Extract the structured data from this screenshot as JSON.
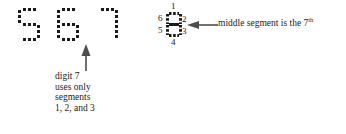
{
  "figure": {
    "background": "#ffffff",
    "ink": "#1a1a1a",
    "digits": [
      {
        "char": "5",
        "segments_on": [
          "top",
          "tl",
          "mid",
          "br",
          "bot"
        ]
      },
      {
        "char": "6",
        "segments_on": [
          "top",
          "tl",
          "mid",
          "bl",
          "br",
          "bot"
        ]
      },
      {
        "char": "7",
        "segments_on": [
          "top",
          "tr",
          "br"
        ]
      }
    ],
    "left_caption": {
      "line1": "digit 7",
      "line2": "uses only",
      "line3": "segments",
      "line4": "1, 2, and 3"
    },
    "segment_labels": {
      "top": "1",
      "upper_right": "2",
      "lower_right": "3",
      "bottom": "4",
      "lower_left": "5",
      "upper_left": "6",
      "middle": "7"
    },
    "right_note": {
      "text": "middle segment is the 7",
      "ordinal_suffix": "th"
    },
    "arrows": {
      "up_arrow": "arrow-up-pointer",
      "left_arrow": "arrow-left-pointer"
    }
  }
}
